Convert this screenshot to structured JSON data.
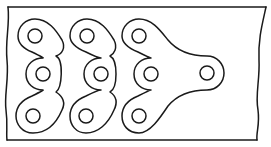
{
  "diagram": {
    "title": "",
    "colors": {
      "line": "#1a1a1a",
      "background": "#ffffff"
    },
    "frame": {
      "top_y": 7,
      "bottom_y": 140,
      "left_x": 8,
      "right_x_top": 266,
      "right_x_bottom": 257
    },
    "links": [
      {
        "id": "link-1",
        "pins": [
          [
            35,
            36
          ],
          [
            43,
            74
          ],
          [
            33,
            116
          ]
        ]
      },
      {
        "id": "link-2",
        "pins": [
          [
            87,
            36
          ],
          [
            101,
            74
          ],
          [
            86,
            116
          ]
        ]
      },
      {
        "id": "link-3",
        "pins": [
          [
            139,
            36
          ],
          [
            151,
            74
          ],
          [
            139,
            116
          ]
        ],
        "end_pin": [
          207,
          73
        ]
      }
    ],
    "pin_radius": 7,
    "lobe_radius": 17
  }
}
